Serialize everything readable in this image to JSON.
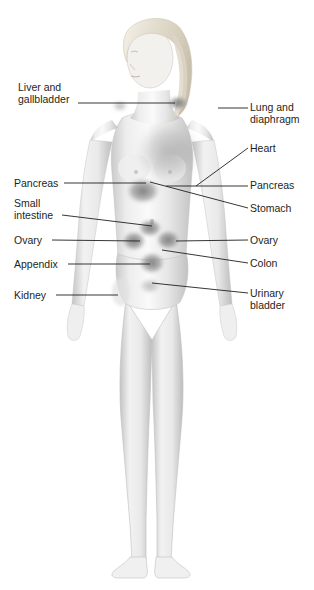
{
  "figure": {
    "style": "grayscale medical illustration with soft shaded organ regions",
    "background_color": "#ffffff",
    "text_color": "#231f20",
    "leader_line_color": "#231f20"
  },
  "labels_left": [
    {
      "id": "liver-gallbladder",
      "lines": [
        "Liver and",
        "gallbladder"
      ],
      "x": 18,
      "y": 82,
      "leader": {
        "x1": 78,
        "y1": 103,
        "x2": 175,
        "y2": 103
      }
    },
    {
      "id": "pancreas-left",
      "lines": [
        "Pancreas"
      ],
      "x": 14,
      "y": 178,
      "leader": {
        "x1": 64,
        "y1": 183,
        "x2": 146,
        "y2": 183
      }
    },
    {
      "id": "small-intestine",
      "lines": [
        "Small",
        "intestine"
      ],
      "x": 14,
      "y": 198,
      "leader": {
        "x1": 62,
        "y1": 215,
        "x2": 152,
        "y2": 226
      }
    },
    {
      "id": "ovary-left",
      "lines": [
        "Ovary"
      ],
      "x": 14,
      "y": 235,
      "leader": {
        "x1": 52,
        "y1": 240,
        "x2": 140,
        "y2": 241
      }
    },
    {
      "id": "appendix",
      "lines": [
        "Appendix"
      ],
      "x": 14,
      "y": 259,
      "leader": {
        "x1": 68,
        "y1": 264,
        "x2": 150,
        "y2": 264
      }
    },
    {
      "id": "kidney",
      "lines": [
        "Kidney"
      ],
      "x": 14,
      "y": 290,
      "leader": {
        "x1": 56,
        "y1": 295,
        "x2": 118,
        "y2": 295
      }
    }
  ],
  "labels_right": [
    {
      "id": "lung-diaphragm",
      "lines": [
        "Lung and",
        "diaphragm"
      ],
      "x": 250,
      "y": 102,
      "leader": {
        "x1": 218,
        "y1": 108,
        "x2": 248,
        "y2": 108
      }
    },
    {
      "id": "heart",
      "lines": [
        "Heart"
      ],
      "x": 250,
      "y": 143,
      "leader": {
        "x1": 196,
        "y1": 186,
        "x2": 248,
        "y2": 148
      }
    },
    {
      "id": "pancreas-right",
      "lines": [
        "Pancreas"
      ],
      "x": 250,
      "y": 180,
      "leader": {
        "x1": 166,
        "y1": 186,
        "x2": 248,
        "y2": 186
      }
    },
    {
      "id": "stomach",
      "lines": [
        "Stomach"
      ],
      "x": 250,
      "y": 203,
      "leader": {
        "x1": 150,
        "y1": 182,
        "x2": 248,
        "y2": 208
      }
    },
    {
      "id": "ovary-right",
      "lines": [
        "Ovary"
      ],
      "x": 250,
      "y": 235,
      "leader": {
        "x1": 176,
        "y1": 241,
        "x2": 248,
        "y2": 240
      }
    },
    {
      "id": "colon",
      "lines": [
        "Colon"
      ],
      "x": 250,
      "y": 258,
      "leader": {
        "x1": 162,
        "y1": 250,
        "x2": 248,
        "y2": 263
      }
    },
    {
      "id": "urinary-bladder",
      "lines": [
        "Urinary",
        "bladder"
      ],
      "x": 250,
      "y": 288,
      "leader": {
        "x1": 152,
        "y1": 283,
        "x2": 248,
        "y2": 293
      }
    }
  ],
  "organ_regions": [
    {
      "id": "lung-diaphragm-marker",
      "shape": "ellipse",
      "cx": 178,
      "cy": 103,
      "rx": 10,
      "ry": 7,
      "tone": "#8d8d8d"
    },
    {
      "id": "liver-shoulder-marker",
      "shape": "ellipse",
      "cx": 120,
      "cy": 106,
      "rx": 8,
      "ry": 6,
      "tone": "#a9a9a9"
    },
    {
      "id": "heart-lung-field",
      "shape": "ellipse",
      "cx": 168,
      "cy": 152,
      "rx": 32,
      "ry": 30,
      "tone": "#b4b4b4"
    },
    {
      "id": "stomach-epigastric",
      "shape": "ellipse",
      "cx": 143,
      "cy": 191,
      "rx": 16,
      "ry": 12,
      "tone": "#969696"
    },
    {
      "id": "small-intestine-umbilical",
      "shape": "ellipse",
      "cx": 150,
      "cy": 228,
      "rx": 12,
      "ry": 9,
      "tone": "#8f8f8f"
    },
    {
      "id": "ovary-left-region",
      "shape": "ellipse",
      "cx": 134,
      "cy": 241,
      "rx": 12,
      "ry": 10,
      "tone": "#8a8a8a"
    },
    {
      "id": "ovary-right-region",
      "shape": "ellipse",
      "cx": 168,
      "cy": 240,
      "rx": 12,
      "ry": 10,
      "tone": "#8a8a8a"
    },
    {
      "id": "colon-region",
      "shape": "ellipse",
      "cx": 152,
      "cy": 263,
      "rx": 13,
      "ry": 11,
      "tone": "#909090"
    },
    {
      "id": "bladder-region",
      "shape": "ellipse",
      "cx": 150,
      "cy": 286,
      "rx": 11,
      "ry": 8,
      "tone": "#9a9a9a"
    },
    {
      "id": "kidney-flank-region",
      "shape": "ellipse",
      "cx": 121,
      "cy": 292,
      "rx": 9,
      "ry": 14,
      "tone": "#d8d8d8"
    }
  ]
}
